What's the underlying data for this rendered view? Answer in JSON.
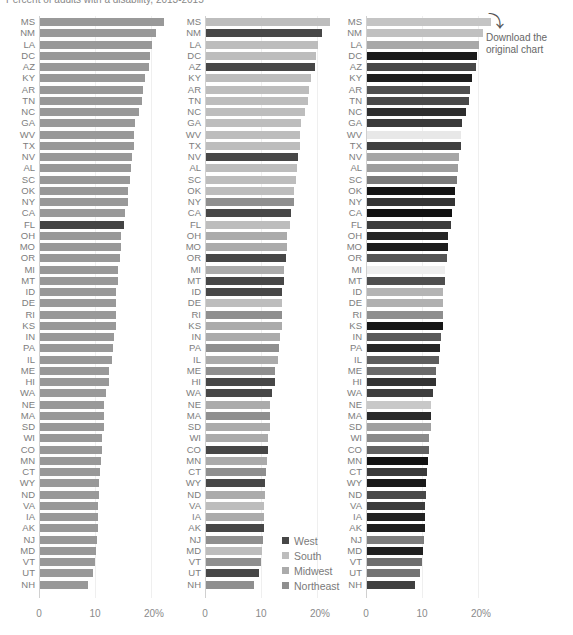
{
  "title": "Percent of adults with a disability, 2013-2015",
  "download": {
    "icon": "curved-arrow-icon",
    "label": "Download the original chart"
  },
  "legend": [
    {
      "label": "West",
      "color": "#474747"
    },
    {
      "label": "South",
      "color": "#bdbdbd"
    },
    {
      "label": "Midwest",
      "color": "#ababab"
    },
    {
      "label": "Northeast",
      "color": "#8f8f8f"
    }
  ],
  "axis_ticks": [
    "0",
    "10",
    "20%"
  ],
  "chart_data": [
    {
      "type": "bar",
      "orientation": "horizontal",
      "title": "Panel 1 (Florida highlighted)",
      "xlabel": "",
      "ylabel": "",
      "xlim": [
        0,
        22
      ],
      "x_ticks": [
        "0",
        "10",
        "20%"
      ],
      "categories": [
        "MS",
        "NM",
        "LA",
        "DC",
        "AZ",
        "KY",
        "AR",
        "TN",
        "NC",
        "GA",
        "WV",
        "TX",
        "NV",
        "AL",
        "SC",
        "OK",
        "NY",
        "CA",
        "FL",
        "OH",
        "MO",
        "OR",
        "MI",
        "MT",
        "ID",
        "DE",
        "RI",
        "KS",
        "IN",
        "PA",
        "IL",
        "ME",
        "HI",
        "WA",
        "NE",
        "MA",
        "SD",
        "WI",
        "CO",
        "MN",
        "CT",
        "WY",
        "ND",
        "VA",
        "IA",
        "AK",
        "NJ",
        "MD",
        "VT",
        "UT",
        "NH"
      ],
      "values": [
        22.1,
        20.8,
        20.0,
        19.7,
        19.4,
        18.7,
        18.4,
        18.2,
        17.7,
        17.0,
        16.8,
        16.7,
        16.4,
        16.2,
        16.1,
        15.8,
        15.7,
        15.2,
        15.0,
        14.4,
        14.4,
        14.2,
        14.0,
        13.9,
        13.6,
        13.6,
        13.5,
        13.5,
        13.3,
        13.0,
        12.8,
        12.4,
        12.4,
        11.7,
        11.5,
        11.5,
        11.4,
        11.1,
        11.1,
        10.9,
        10.7,
        10.6,
        10.5,
        10.4,
        10.4,
        10.4,
        10.1,
        10.0,
        9.9,
        9.5,
        8.6
      ],
      "colors": [
        "#999999",
        "#999999",
        "#999999",
        "#999999",
        "#999999",
        "#999999",
        "#999999",
        "#999999",
        "#999999",
        "#999999",
        "#999999",
        "#999999",
        "#999999",
        "#999999",
        "#999999",
        "#999999",
        "#999999",
        "#999999",
        "#444444",
        "#999999",
        "#999999",
        "#999999",
        "#999999",
        "#999999",
        "#999999",
        "#999999",
        "#999999",
        "#999999",
        "#999999",
        "#999999",
        "#999999",
        "#999999",
        "#999999",
        "#999999",
        "#999999",
        "#999999",
        "#999999",
        "#999999",
        "#999999",
        "#999999",
        "#999999",
        "#999999",
        "#999999",
        "#999999",
        "#999999",
        "#999999",
        "#999999",
        "#999999",
        "#999999",
        "#999999",
        "#999999"
      ]
    },
    {
      "type": "bar",
      "orientation": "horizontal",
      "title": "Panel 2 (by region)",
      "xlim": [
        0,
        22
      ],
      "x_ticks": [
        "0",
        "10",
        "20%"
      ],
      "legend": [
        "West",
        "South",
        "Midwest",
        "Northeast"
      ],
      "categories": [
        "MS",
        "NM",
        "LA",
        "DC",
        "AZ",
        "KY",
        "AR",
        "TN",
        "NC",
        "GA",
        "WV",
        "TX",
        "NV",
        "AL",
        "SC",
        "OK",
        "NY",
        "CA",
        "FL",
        "OH",
        "MO",
        "OR",
        "MI",
        "MT",
        "ID",
        "DE",
        "RI",
        "KS",
        "IN",
        "PA",
        "IL",
        "ME",
        "HI",
        "WA",
        "NE",
        "MA",
        "SD",
        "WI",
        "CO",
        "MN",
        "CT",
        "WY",
        "ND",
        "VA",
        "IA",
        "AK",
        "NJ",
        "MD",
        "VT",
        "UT",
        "NH"
      ],
      "values": [
        22.1,
        20.8,
        20.0,
        19.7,
        19.4,
        18.7,
        18.4,
        18.2,
        17.7,
        17.0,
        16.8,
        16.7,
        16.4,
        16.2,
        16.1,
        15.8,
        15.7,
        15.2,
        15.0,
        14.4,
        14.4,
        14.2,
        14.0,
        13.9,
        13.6,
        13.6,
        13.5,
        13.5,
        13.3,
        13.0,
        12.8,
        12.4,
        12.4,
        11.7,
        11.5,
        11.5,
        11.4,
        11.1,
        11.1,
        10.9,
        10.7,
        10.6,
        10.5,
        10.4,
        10.4,
        10.4,
        10.1,
        10.0,
        9.9,
        9.5,
        8.6
      ],
      "regions": [
        "South",
        "West",
        "South",
        "South",
        "West",
        "South",
        "South",
        "South",
        "South",
        "South",
        "South",
        "South",
        "West",
        "South",
        "South",
        "South",
        "Northeast",
        "West",
        "South",
        "Midwest",
        "Midwest",
        "West",
        "Midwest",
        "West",
        "West",
        "South",
        "Northeast",
        "Midwest",
        "Midwest",
        "Northeast",
        "Midwest",
        "Northeast",
        "West",
        "West",
        "Midwest",
        "Northeast",
        "Midwest",
        "Midwest",
        "West",
        "Midwest",
        "Northeast",
        "West",
        "Midwest",
        "South",
        "Midwest",
        "West",
        "Northeast",
        "South",
        "Northeast",
        "West",
        "Northeast"
      ],
      "colors": [
        "#bdbdbd",
        "#474747",
        "#bdbdbd",
        "#bdbdbd",
        "#474747",
        "#bdbdbd",
        "#bdbdbd",
        "#bdbdbd",
        "#bdbdbd",
        "#bdbdbd",
        "#bdbdbd",
        "#bdbdbd",
        "#474747",
        "#bdbdbd",
        "#bdbdbd",
        "#bdbdbd",
        "#8f8f8f",
        "#474747",
        "#bdbdbd",
        "#ababab",
        "#ababab",
        "#474747",
        "#ababab",
        "#474747",
        "#474747",
        "#bdbdbd",
        "#8f8f8f",
        "#ababab",
        "#ababab",
        "#8f8f8f",
        "#ababab",
        "#8f8f8f",
        "#474747",
        "#474747",
        "#ababab",
        "#8f8f8f",
        "#ababab",
        "#ababab",
        "#474747",
        "#ababab",
        "#8f8f8f",
        "#474747",
        "#ababab",
        "#bdbdbd",
        "#ababab",
        "#474747",
        "#8f8f8f",
        "#bdbdbd",
        "#8f8f8f",
        "#474747",
        "#8f8f8f"
      ]
    },
    {
      "type": "bar",
      "orientation": "horizontal",
      "title": "Panel 3 (shaded)",
      "xlim": [
        0,
        22
      ],
      "x_ticks": [
        "0",
        "10",
        "20%"
      ],
      "categories": [
        "MS",
        "NM",
        "LA",
        "DC",
        "AZ",
        "KY",
        "AR",
        "TN",
        "NC",
        "GA",
        "WV",
        "TX",
        "NV",
        "AL",
        "SC",
        "OK",
        "NY",
        "CA",
        "FL",
        "OH",
        "MO",
        "OR",
        "MI",
        "MT",
        "ID",
        "DE",
        "RI",
        "KS",
        "IN",
        "PA",
        "IL",
        "ME",
        "HI",
        "WA",
        "NE",
        "MA",
        "SD",
        "WI",
        "CO",
        "MN",
        "CT",
        "WY",
        "ND",
        "VA",
        "IA",
        "AK",
        "NJ",
        "MD",
        "VT",
        "UT",
        "NH"
      ],
      "values": [
        22.1,
        20.8,
        20.0,
        19.7,
        19.4,
        18.7,
        18.4,
        18.2,
        17.7,
        17.0,
        16.8,
        16.7,
        16.4,
        16.2,
        16.1,
        15.8,
        15.7,
        15.2,
        15.0,
        14.4,
        14.4,
        14.2,
        14.0,
        13.9,
        13.6,
        13.6,
        13.5,
        13.5,
        13.3,
        13.0,
        12.8,
        12.4,
        12.4,
        11.7,
        11.5,
        11.5,
        11.4,
        11.1,
        11.1,
        10.9,
        10.7,
        10.6,
        10.5,
        10.4,
        10.4,
        10.4,
        10.1,
        10.0,
        9.9,
        9.5,
        8.6
      ],
      "colors": [
        "#c4c4c4",
        "#c0c0c0",
        "#a8a8a8",
        "#1a1a1a",
        "#484848",
        "#1e1e1e",
        "#505050",
        "#4a4a4a",
        "#2e2e2e",
        "#3a3a3a",
        "#e8e8e8",
        "#404040",
        "#a6a6a6",
        "#9e9e9e",
        "#7a7a7a",
        "#141414",
        "#353535",
        "#111111",
        "#3c3c3c",
        "#252525",
        "#1c1c1c",
        "#555555",
        "#eeeeee",
        "#4e4e4e",
        "#b4b4b4",
        "#b0b0b0",
        "#8e8e8e",
        "#161616",
        "#5a5a5a",
        "#262626",
        "#5e5e5e",
        "#6a6a6a",
        "#333333",
        "#3e3e3e",
        "#c8c8c8",
        "#2a2a2a",
        "#a0a0a0",
        "#8a8a8a",
        "#626262",
        "#121212",
        "#3a3a3a",
        "#1a1a1a",
        "#484848",
        "#3c3c3c",
        "#222222",
        "#1e1e1e",
        "#7e7e7e",
        "#202020",
        "#6e6e6e",
        "#747474",
        "#404040"
      ]
    }
  ]
}
